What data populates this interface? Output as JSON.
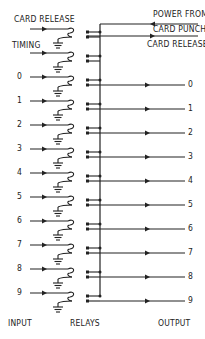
{
  "diagram": {
    "top_labels": {
      "card_release_in": "CARD RELEASE",
      "timing": "TIMING",
      "power_from_line1": "POWER FROM",
      "power_from_line2": "CARD PUNCH",
      "card_release_out": "CARD RELEASE"
    },
    "inputs": [
      "0",
      "1",
      "2",
      "3",
      "4",
      "5",
      "6",
      "7",
      "8",
      "9"
    ],
    "outputs": [
      "0",
      "1",
      "2",
      "3",
      "4",
      "5",
      "6",
      "7",
      "8",
      "9"
    ],
    "footer": {
      "input": "INPUT",
      "relays": "RELAYS",
      "output": "OUTPUT"
    },
    "colors": {
      "line": "#222222",
      "background": "#ffffff"
    }
  }
}
